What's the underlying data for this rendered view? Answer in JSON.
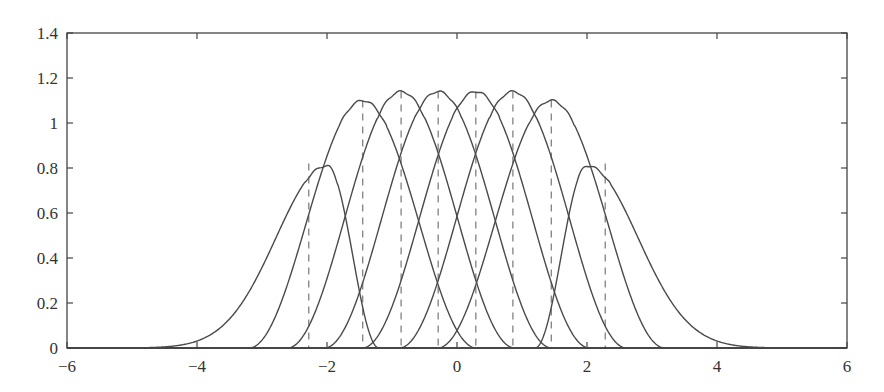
{
  "chart_data": {
    "type": "line",
    "title": "",
    "xlabel": "",
    "ylabel": "",
    "xlim": [
      -6,
      6
    ],
    "ylim": [
      0,
      1.4
    ],
    "grid": false,
    "legend": null,
    "xticks": [
      -6,
      -4,
      -2,
      0,
      2,
      4,
      6
    ],
    "xtick_labels": [
      "−6",
      "−4",
      "−2",
      "0",
      "2",
      "4",
      "6"
    ],
    "yticks": [
      0,
      0.2,
      0.4,
      0.6,
      0.8,
      1,
      1.2,
      1.4
    ],
    "ytick_labels": [
      "0",
      "0.2",
      "0.4",
      "0.6",
      "0.8",
      "1",
      "1.2",
      "1.4"
    ],
    "series": [
      {
        "name": "curve-1 (outer left)",
        "peak_x": -2.0,
        "peak_y": 0.81,
        "kind": "outer-left",
        "points": [
          [
            -6,
            0.0
          ],
          [
            -5,
            0.003
          ],
          [
            -4.5,
            0.01
          ],
          [
            -4,
            0.03
          ],
          [
            -3.5,
            0.1
          ],
          [
            -3,
            0.27
          ],
          [
            -2.68,
            0.45
          ],
          [
            -2.4,
            0.65
          ],
          [
            -2.2,
            0.76
          ],
          [
            -2.0,
            0.81
          ],
          [
            -1.75,
            0.67
          ],
          [
            -1.45,
            0.25
          ],
          [
            -1.22,
            0.0
          ]
        ]
      },
      {
        "name": "curve-2",
        "peak_x": -1.45,
        "peak_y": 1.1,
        "kind": "inner",
        "points": [
          [
            -3.2,
            0.0
          ],
          [
            -2.88,
            0.07
          ],
          [
            -2.6,
            0.29
          ],
          [
            -2.03,
            0.84
          ],
          [
            -1.45,
            1.1
          ],
          [
            -0.87,
            0.84
          ],
          [
            -0.3,
            0.29
          ],
          [
            0.0,
            0.06
          ],
          [
            0.3,
            0.0
          ]
        ]
      },
      {
        "name": "curve-3",
        "peak_x": -0.86,
        "peak_y": 1.14,
        "kind": "inner",
        "points": [
          [
            -2.6,
            0.0
          ],
          [
            -2.0,
            0.29
          ],
          [
            -1.44,
            0.88
          ],
          [
            -0.86,
            1.14
          ],
          [
            -0.29,
            0.88
          ],
          [
            0.29,
            0.29
          ],
          [
            0.88,
            0.0
          ]
        ]
      },
      {
        "name": "curve-4",
        "peak_x": -0.29,
        "peak_y": 1.14,
        "kind": "inner",
        "points": [
          [
            -2.0,
            0.0
          ],
          [
            -1.44,
            0.29
          ],
          [
            -0.86,
            0.88
          ],
          [
            -0.29,
            1.14
          ],
          [
            0.29,
            0.88
          ],
          [
            0.86,
            0.29
          ],
          [
            1.44,
            0.0
          ]
        ]
      },
      {
        "name": "curve-5",
        "peak_x": 0.29,
        "peak_y": 1.14,
        "kind": "inner",
        "points": [
          [
            -1.44,
            0.0
          ],
          [
            -0.86,
            0.29
          ],
          [
            -0.29,
            0.88
          ],
          [
            0.29,
            1.14
          ],
          [
            0.86,
            0.88
          ],
          [
            1.44,
            0.29
          ],
          [
            2.0,
            0.0
          ]
        ]
      },
      {
        "name": "curve-6",
        "peak_x": 0.86,
        "peak_y": 1.14,
        "kind": "inner",
        "points": [
          [
            -0.88,
            0.0
          ],
          [
            -0.29,
            0.29
          ],
          [
            0.29,
            0.88
          ],
          [
            0.86,
            1.14
          ],
          [
            1.44,
            0.88
          ],
          [
            2.0,
            0.29
          ],
          [
            2.6,
            0.0
          ]
        ]
      },
      {
        "name": "curve-7",
        "peak_x": 1.45,
        "peak_y": 1.1,
        "kind": "inner",
        "points": [
          [
            -0.3,
            0.0
          ],
          [
            0.0,
            0.06
          ],
          [
            0.3,
            0.29
          ],
          [
            0.87,
            0.84
          ],
          [
            1.45,
            1.1
          ],
          [
            2.03,
            0.84
          ],
          [
            2.6,
            0.29
          ],
          [
            2.88,
            0.07
          ],
          [
            3.2,
            0.0
          ]
        ]
      },
      {
        "name": "curve-8 (outer right)",
        "peak_x": 2.0,
        "peak_y": 0.81,
        "kind": "outer-right",
        "points": [
          [
            1.22,
            0.0
          ],
          [
            1.45,
            0.25
          ],
          [
            1.75,
            0.67
          ],
          [
            2.0,
            0.81
          ],
          [
            2.28,
            0.75
          ],
          [
            2.6,
            0.55
          ],
          [
            2.86,
            0.33
          ],
          [
            3.2,
            0.16
          ],
          [
            3.5,
            0.09
          ],
          [
            4,
            0.03
          ],
          [
            4.5,
            0.01
          ],
          [
            5,
            0.003
          ],
          [
            6,
            0.0
          ]
        ]
      }
    ],
    "dashed_lines": [
      {
        "x": -2.28,
        "y_top": 0.82
      },
      {
        "x": -1.45,
        "y_top": 1.1
      },
      {
        "x": -0.86,
        "y_top": 1.14
      },
      {
        "x": -0.29,
        "y_top": 1.14
      },
      {
        "x": 0.29,
        "y_top": 1.14
      },
      {
        "x": 0.86,
        "y_top": 1.14
      },
      {
        "x": 1.45,
        "y_top": 1.1
      },
      {
        "x": 2.28,
        "y_top": 0.82
      }
    ],
    "colors": {
      "curve": "#4a4a4a",
      "dashed": "#6a6a6a",
      "axes": "#444444",
      "background": "#ffffff"
    }
  }
}
